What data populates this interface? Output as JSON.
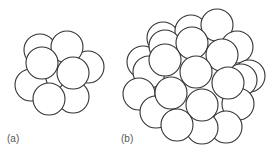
{
  "figure": {
    "sphere_fill": "#ffffff",
    "sphere_stroke": "#333333",
    "label_color": "#555555",
    "panels": [
      {
        "label": "(a)",
        "label_pos": [
          7,
          142
        ],
        "radius": 16,
        "spheres": [
          [
            40,
            50
          ],
          [
            88,
            67
          ],
          [
            31,
            85
          ],
          [
            73,
            97
          ],
          [
            67,
            47
          ],
          [
            42,
            63
          ],
          [
            73,
            73
          ],
          [
            49,
            99
          ]
        ]
      },
      {
        "label": "(b)",
        "label_pos": [
          121,
          142
        ],
        "radius": 16,
        "spheres": [
          [
            163,
            38
          ],
          [
            191,
            31
          ],
          [
            217,
            25
          ],
          [
            237,
            47
          ],
          [
            249,
            76
          ],
          [
            241,
            80
          ],
          [
            143,
            62
          ],
          [
            149,
            72
          ],
          [
            139,
            94
          ],
          [
            156,
            112
          ],
          [
            238,
            104
          ],
          [
            226,
            127
          ],
          [
            202,
            128
          ],
          [
            165,
            46
          ],
          [
            192,
            43
          ],
          [
            222,
            55
          ],
          [
            165,
            60
          ],
          [
            196,
            72
          ],
          [
            228,
            83
          ],
          [
            171,
            93
          ],
          [
            202,
            105
          ],
          [
            177,
            125
          ]
        ]
      }
    ]
  }
}
